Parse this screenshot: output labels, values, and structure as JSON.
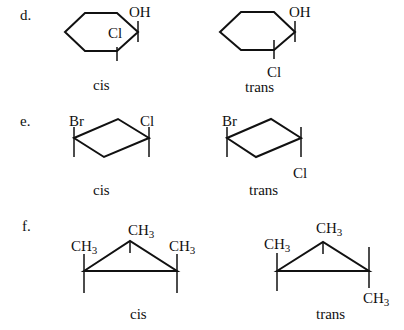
{
  "colors": {
    "ink": "#111111",
    "background": "#ffffff"
  },
  "problems": [
    {
      "label": "d.",
      "structure": "cyclohexane",
      "cis": {
        "caption": "cis",
        "substituents": [
          "OH",
          "Cl"
        ]
      },
      "trans": {
        "caption": "trans",
        "substituents": [
          "OH",
          "Cl"
        ]
      }
    },
    {
      "label": "e.",
      "structure": "cyclobutane",
      "cis": {
        "caption": "cis",
        "substituents": [
          "Br",
          "Cl"
        ]
      },
      "trans": {
        "caption": "trans",
        "substituents": [
          "Br",
          "Cl"
        ]
      }
    },
    {
      "label": "f.",
      "structure": "cyclopropane",
      "cis": {
        "caption": "cis",
        "substituents": [
          "CH",
          "CH",
          "CH"
        ],
        "subscript": "3"
      },
      "trans": {
        "caption": "trans",
        "substituents": [
          "CH",
          "CH",
          "CH"
        ],
        "subscript": "3"
      }
    }
  ]
}
